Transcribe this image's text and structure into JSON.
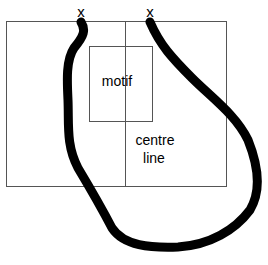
{
  "diagram": {
    "markers": [
      {
        "label": "x"
      },
      {
        "label": "x"
      }
    ],
    "labels": {
      "motif": "motif",
      "centre_line_1": "centre",
      "centre_line_2": "line"
    },
    "colors": {
      "background": "#ffffff",
      "thin_line": "#555555",
      "thick_path": "#000000",
      "text": "#000000"
    }
  }
}
